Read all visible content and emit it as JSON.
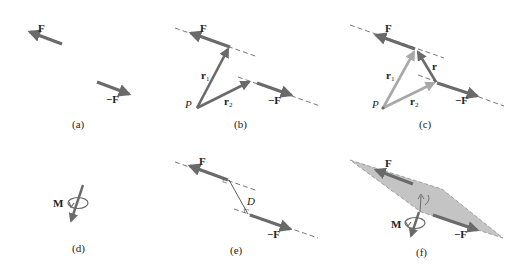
{
  "figure": {
    "colors": {
      "force_arrow": "#6a6a6a",
      "light_vector": "#a8a8a8",
      "dashed_line": "#555555",
      "plane_fill": "#c4c4c4",
      "text": "#222222"
    },
    "panels": [
      {
        "id": "a",
        "caption": "(a)",
        "labels": {
          "force": "F",
          "neg_force": "−F"
        }
      },
      {
        "id": "b",
        "caption": "(b)",
        "labels": {
          "force": "F",
          "neg_force": "−F",
          "point": "P",
          "r1_base": "r",
          "r1_sub": "1",
          "r2_base": "r",
          "r2_sub": "2"
        }
      },
      {
        "id": "c",
        "caption": "(c)",
        "labels": {
          "force": "F",
          "neg_force": "−F",
          "point": "P",
          "r1_base": "r",
          "r1_sub": "1",
          "r2_base": "r",
          "r2_sub": "2",
          "r": "r"
        }
      },
      {
        "id": "d",
        "caption": "(d)",
        "labels": {
          "moment": "M"
        }
      },
      {
        "id": "e",
        "caption": "(e)",
        "labels": {
          "force": "F",
          "neg_force": "−F",
          "distance": "D"
        }
      },
      {
        "id": "f",
        "caption": "(f)",
        "labels": {
          "force": "F",
          "neg_force": "−F",
          "moment": "M"
        }
      }
    ]
  }
}
